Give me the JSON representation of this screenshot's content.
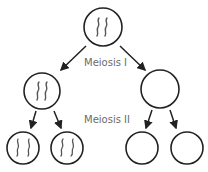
{
  "diagram": {
    "title": "Meiosis",
    "stages": [
      {
        "id": "meiosis-1",
        "label": "Meiosis I"
      },
      {
        "id": "meiosis-2",
        "label": "Meiosis II"
      }
    ],
    "cells": [
      {
        "id": "parent",
        "level": 0,
        "chromosomes": 2
      },
      {
        "id": "daughter-left",
        "level": 1,
        "chromosomes": 2
      },
      {
        "id": "daughter-right",
        "level": 1,
        "chromosomes": 0
      },
      {
        "id": "gamete-1",
        "level": 2,
        "chromosomes": 2
      },
      {
        "id": "gamete-2",
        "level": 2,
        "chromosomes": 2
      },
      {
        "id": "gamete-3",
        "level": 2,
        "chromosomes": 0
      },
      {
        "id": "gamete-4",
        "level": 2,
        "chromosomes": 0
      }
    ],
    "colors": {
      "outline": "#222222",
      "chromosome": "#555555",
      "label": "#6b6b6b"
    }
  }
}
